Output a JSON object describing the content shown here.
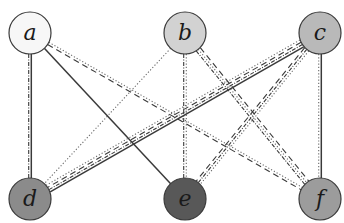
{
  "diagram": {
    "type": "complete-bipartite-graph",
    "title": "",
    "nodes": [
      {
        "id": "a",
        "label": "a",
        "x": 30,
        "y": 33,
        "fill": "#f7f7f7",
        "row": "top"
      },
      {
        "id": "b",
        "label": "b",
        "x": 185,
        "y": 33,
        "fill": "#d2d2d2",
        "row": "top"
      },
      {
        "id": "c",
        "label": "c",
        "x": 320,
        "y": 33,
        "fill": "#b9b9b9",
        "row": "top"
      },
      {
        "id": "d",
        "label": "d",
        "x": 30,
        "y": 199,
        "fill": "#8b8b8b",
        "row": "bottom"
      },
      {
        "id": "e",
        "label": "e",
        "x": 185,
        "y": 199,
        "fill": "#585858",
        "row": "bottom"
      },
      {
        "id": "f",
        "label": "f",
        "x": 320,
        "y": 199,
        "fill": "#9c9c9c",
        "row": "bottom"
      }
    ],
    "node_radius": 21,
    "node_stroke": "#3a3a3a",
    "edge_color": "#3a3a3a",
    "line_styles": {
      "solid": "",
      "dashed": "6 4",
      "dotted": "1.2 2",
      "dashdot": "4 1.5 1 1.5"
    },
    "edges": [
      {
        "from": "a",
        "to": "d",
        "styles": [
          "solid",
          "dashdot"
        ]
      },
      {
        "from": "a",
        "to": "e",
        "styles": [
          "solid"
        ]
      },
      {
        "from": "a",
        "to": "f",
        "styles": [
          "dotted",
          "dashed"
        ]
      },
      {
        "from": "b",
        "to": "d",
        "styles": [
          "dotted"
        ]
      },
      {
        "from": "b",
        "to": "e",
        "styles": [
          "dotted",
          "dashdot"
        ]
      },
      {
        "from": "b",
        "to": "f",
        "styles": [
          "dashed",
          "dotted",
          "dashdot"
        ]
      },
      {
        "from": "c",
        "to": "d",
        "styles": [
          "solid",
          "dashdot",
          "dashed",
          "dotted"
        ]
      },
      {
        "from": "c",
        "to": "e",
        "styles": [
          "dotted",
          "dashdot",
          "dashed"
        ]
      },
      {
        "from": "c",
        "to": "f",
        "styles": [
          "solid",
          "dotted"
        ]
      }
    ]
  }
}
